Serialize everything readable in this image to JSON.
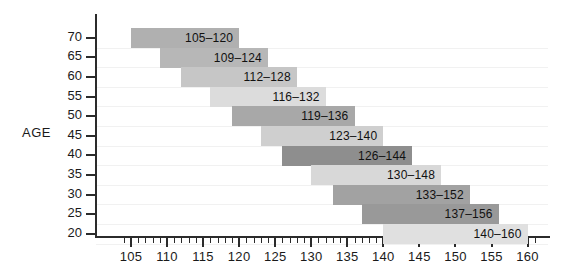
{
  "chart_data": {
    "type": "bar",
    "orientation": "horizontal-range",
    "title": "",
    "subtitle": "",
    "xlabel": "",
    "ylabel": "AGE",
    "xlim": [
      103,
      161
    ],
    "ylim": [
      17,
      72
    ],
    "grid": true,
    "legend": null,
    "x_ticks": [
      105,
      110,
      115,
      120,
      125,
      130,
      135,
      140,
      145,
      150,
      155,
      160
    ],
    "x_minor_tick_step": 1,
    "y_ticks": [
      70,
      65,
      60,
      55,
      50,
      45,
      40,
      35,
      30,
      25,
      20
    ],
    "categories": [
      "70",
      "65",
      "60",
      "55",
      "50",
      "45",
      "40",
      "35",
      "30",
      "25",
      "20"
    ],
    "bars": [
      {
        "age": "70",
        "label": "105–120",
        "start": 105,
        "end": 120,
        "color": "#b0b0b0"
      },
      {
        "age": "65",
        "label": "109–124",
        "start": 109,
        "end": 124,
        "color": "#b7b7b7"
      },
      {
        "age": "60",
        "label": "112–128",
        "start": 112,
        "end": 128,
        "color": "#c6c6c6"
      },
      {
        "age": "55",
        "label": "116–132",
        "start": 116,
        "end": 132,
        "color": "#dcdcdc"
      },
      {
        "age": "50",
        "label": "119–136",
        "start": 119,
        "end": 136,
        "color": "#a8a8a8"
      },
      {
        "age": "45",
        "label": "123–140",
        "start": 123,
        "end": 140,
        "color": "#cfcfcf"
      },
      {
        "age": "40",
        "label": "126–144",
        "start": 126,
        "end": 144,
        "color": "#8e8e8e"
      },
      {
        "age": "35",
        "label": "130–148",
        "start": 130,
        "end": 148,
        "color": "#d8d8d8"
      },
      {
        "age": "30",
        "label": "133–152",
        "start": 133,
        "end": 152,
        "color": "#a2a2a2"
      },
      {
        "age": "25",
        "label": "137–156",
        "start": 137,
        "end": 156,
        "color": "#999999"
      },
      {
        "age": "20",
        "label": "140–160",
        "start": 140,
        "end": 160,
        "color": "#e0e0e0"
      }
    ]
  },
  "axis": {
    "y_title": "AGE"
  },
  "colors": {
    "axis": "#2b2b2b",
    "text": "#1a1a1a",
    "grid": "#f1f1f1",
    "background": "#ffffff"
  }
}
